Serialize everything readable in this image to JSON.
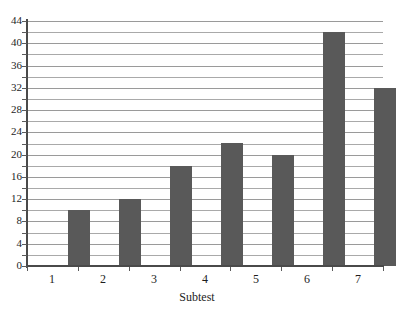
{
  "chart_data": {
    "type": "bar",
    "title": "",
    "categories": [
      "1",
      "2",
      "3",
      "4",
      "5",
      "6",
      "7"
    ],
    "values": [
      10,
      12,
      18,
      22,
      20,
      42,
      32
    ],
    "xlabel": "Subtest",
    "ylabel": "",
    "ylim": [
      0,
      44
    ],
    "ytick_labels": [
      "0",
      "4",
      "8",
      "12",
      "16",
      "20",
      "24",
      "28",
      "32",
      "36",
      "40",
      "44"
    ],
    "ytick_step": 4,
    "gridline_step": 2,
    "grid": true,
    "legend": "none",
    "bar_color": "#595959",
    "gridline_color": "#a9a9a9",
    "axis_color": "#4a4a4a"
  },
  "title_clipped": "—"
}
